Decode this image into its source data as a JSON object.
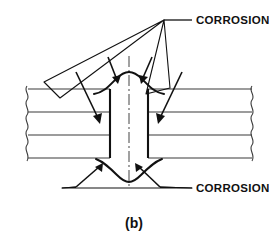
{
  "figure": {
    "caption": "(b)",
    "labels": {
      "top_corrosion": "CORROSION",
      "bottom_corrosion": "CORROSION"
    },
    "colors": {
      "ink": "#111111",
      "plate_line": "#3a3a3a",
      "background": "#ffffff"
    },
    "parts": {
      "plate_stack_name": "riveted plate stack section",
      "hole_name": "fastener hole",
      "centerline_name": "vertical centerline",
      "top_corrosion_name": "corroded upper surface",
      "bottom_corrosion_name": "corroded lower surface",
      "break_line_left": "left break line",
      "break_line_right": "right break line"
    },
    "geometry": {
      "plate_lines_y": [
        89,
        112,
        135,
        158
      ],
      "plate_left_x": 27,
      "plate_right_x": 252,
      "hole_left_x": 110,
      "hole_right_x": 148,
      "hole_top_y": 89,
      "hole_bottom_y": 158,
      "centerline_x": 129,
      "centerline_top_y": 56,
      "centerline_bottom_y": 186,
      "top_leader_apex": [
        164,
        20
      ],
      "bottom_leader_label_anchor": [
        196,
        188
      ]
    }
  }
}
